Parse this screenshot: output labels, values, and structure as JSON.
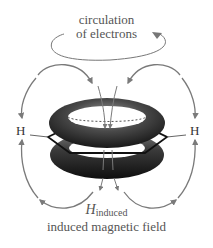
{
  "diagram": {
    "title_line1": "circulation",
    "title_line2": "of electrons",
    "atom_left": "H",
    "atom_right": "H",
    "field_symbol": "H",
    "field_subscript": "induced",
    "caption": "induced magnetic field",
    "colors": {
      "arrows": "#7a7a7a",
      "torus_dark": "#1e1e1e",
      "torus_light": "#8a8a8a",
      "text": "#555555",
      "ring_bonds": "#111111"
    },
    "elements": [
      "electron circulation ellipse with arrow",
      "two stacked pi-electron tori above and below benzene ring",
      "hexagonal benzene ring skeleton",
      "induced field lines looping from top through ring center to bottom",
      "field lines curving around outside past H atoms"
    ]
  }
}
